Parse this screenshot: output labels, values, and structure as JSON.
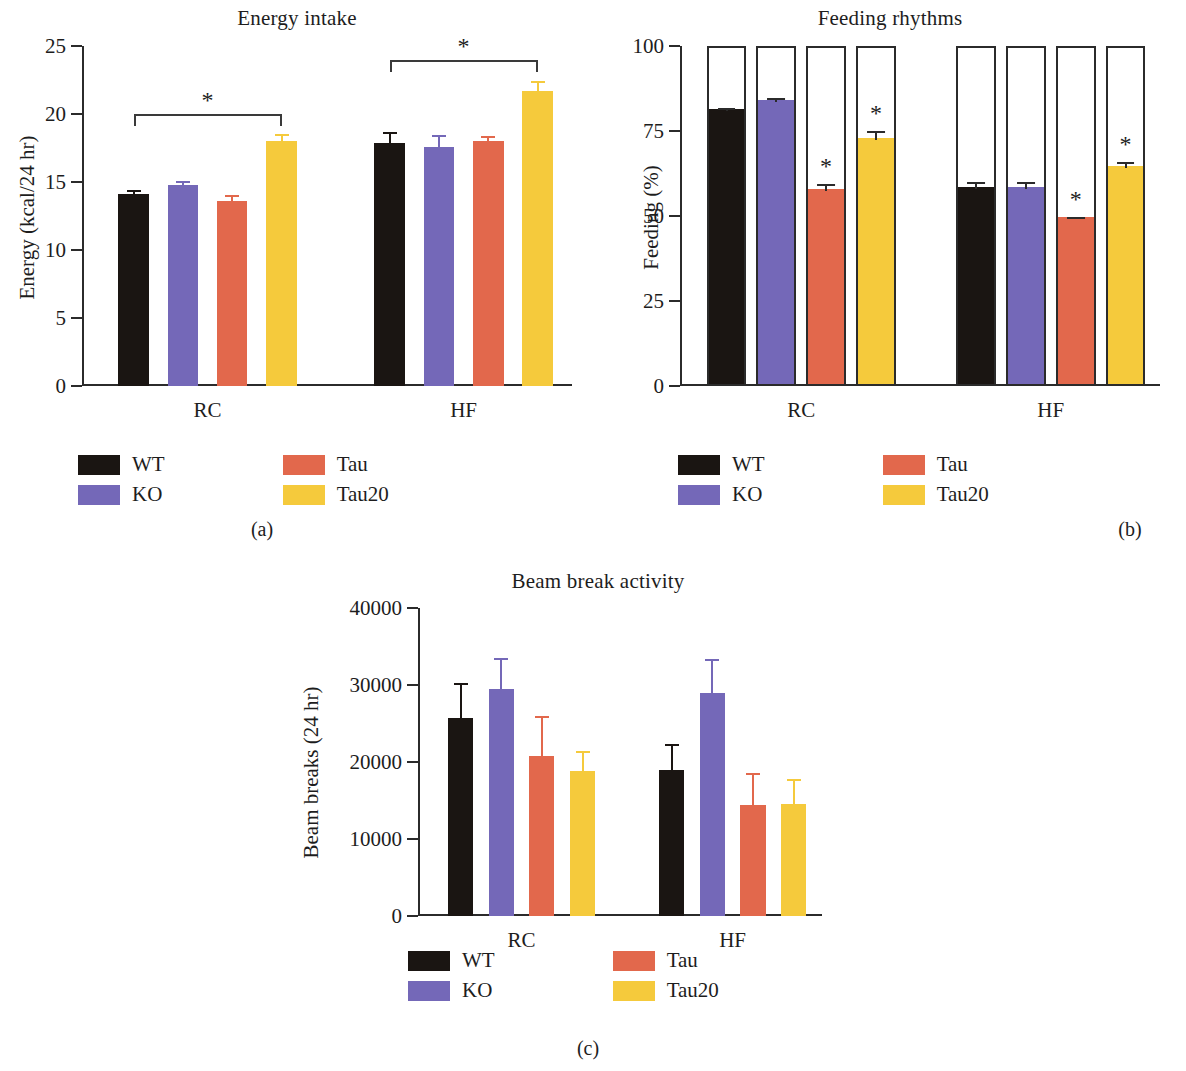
{
  "figure": {
    "groups": [
      "RC",
      "HF"
    ],
    "series_names": [
      "WT",
      "KO",
      "Tau",
      "Tau20"
    ],
    "colors": {
      "WT": "#1a1512",
      "KO": "#7468b8",
      "Tau": "#e2684c",
      "Tau20": "#f5ca3c",
      "axis": "#2b2b2b",
      "text": "#1d1d1d"
    },
    "legend": {
      "items": [
        {
          "label": "WT",
          "color": "#1a1512"
        },
        {
          "label": "KO",
          "color": "#7468b8"
        },
        {
          "label": "Tau",
          "color": "#e2684c"
        },
        {
          "label": "Tau20",
          "color": "#f5ca3c"
        }
      ]
    },
    "captions": {
      "a": "(a)",
      "b": "(b)",
      "c": "(c)"
    },
    "significance_marker": "*"
  },
  "chart_data": [
    {
      "panel": "a",
      "type": "bar",
      "title": "Energy intake",
      "xlabel": "",
      "ylabel": "Energy (kcal/24 hr)",
      "ylim": [
        0,
        25
      ],
      "yticks": [
        0,
        5,
        10,
        15,
        20,
        25
      ],
      "ytick_labels": [
        "0",
        "5",
        "10",
        "15",
        "20",
        "25"
      ],
      "grid": false,
      "legend_position": "below",
      "categories": [
        "RC",
        "HF"
      ],
      "series": [
        {
          "name": "WT",
          "values": [
            14.1,
            17.9
          ],
          "errors": [
            0.35,
            0.75
          ]
        },
        {
          "name": "KO",
          "values": [
            14.8,
            17.6
          ],
          "errors": [
            0.3,
            0.85
          ]
        },
        {
          "name": "Tau",
          "values": [
            13.6,
            18.0
          ],
          "errors": [
            0.45,
            0.35
          ]
        },
        {
          "name": "Tau20",
          "values": [
            18.0,
            21.7
          ],
          "errors": [
            0.5,
            0.75
          ]
        }
      ],
      "annotations": [
        {
          "type": "significance-bracket",
          "group": "RC",
          "from": "WT",
          "to": "Tau20",
          "label": "*",
          "y": 20.0
        },
        {
          "type": "significance-bracket",
          "group": "HF",
          "from": "WT",
          "to": "Tau20",
          "label": "*",
          "y": 24.0
        }
      ]
    },
    {
      "panel": "b",
      "type": "bar",
      "title": "Feeding rhythms",
      "xlabel": "",
      "ylabel": "Feeding (%)",
      "ylim": [
        0,
        100
      ],
      "yticks": [
        0,
        25,
        50,
        75,
        100
      ],
      "ytick_labels": [
        "0",
        "25",
        "50",
        "75",
        "100"
      ],
      "grid": false,
      "legend_position": "below",
      "note": "each bar is a 100% outlined frame filled from the bottom to the feeding value",
      "categories": [
        "RC",
        "HF"
      ],
      "series": [
        {
          "name": "WT",
          "values": [
            81,
            58
          ],
          "errors": [
            0.8,
            2.0
          ],
          "significant": [
            false,
            false
          ]
        },
        {
          "name": "KO",
          "values": [
            83.5,
            58
          ],
          "errors": [
            1.2,
            2.0
          ],
          "significant": [
            false,
            false
          ]
        },
        {
          "name": "Tau",
          "values": [
            57.5,
            49
          ],
          "errors": [
            2.0,
            0.6
          ],
          "significant": [
            true,
            true
          ]
        },
        {
          "name": "Tau20",
          "values": [
            72.5,
            64
          ],
          "errors": [
            2.5,
            2.0
          ],
          "significant": [
            true,
            true
          ]
        }
      ]
    },
    {
      "panel": "c",
      "type": "bar",
      "title": "Beam break activity",
      "xlabel": "",
      "ylabel": "Beam breaks (24 hr)",
      "ylim": [
        0,
        40000
      ],
      "yticks": [
        0,
        10000,
        20000,
        30000,
        40000
      ],
      "ytick_labels": [
        "0",
        "10000",
        "20000",
        "30000",
        "40000"
      ],
      "grid": false,
      "legend_position": "below",
      "categories": [
        "RC",
        "HF"
      ],
      "series": [
        {
          "name": "WT",
          "values": [
            25700,
            18900
          ],
          "errors": [
            4500,
            3500
          ]
        },
        {
          "name": "KO",
          "values": [
            29500,
            29000
          ],
          "errors": [
            4000,
            4400
          ]
        },
        {
          "name": "Tau",
          "values": [
            20800,
            14400
          ],
          "errors": [
            5200,
            4200
          ]
        },
        {
          "name": "Tau20",
          "values": [
            18800,
            14500
          ],
          "errors": [
            2600,
            3300
          ]
        }
      ]
    }
  ]
}
